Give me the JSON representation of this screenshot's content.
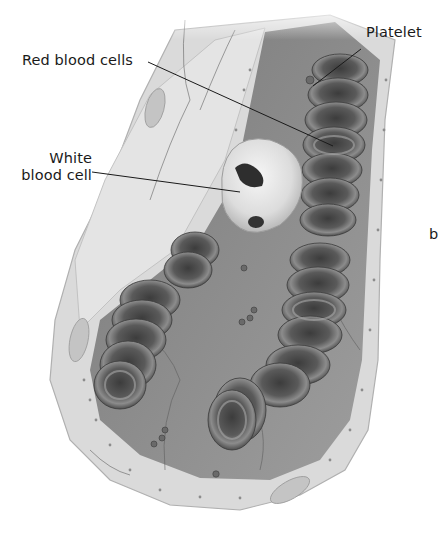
{
  "diagram": {
    "labels": [
      {
        "id": "red-blood-cells",
        "text": "Red blood cells",
        "x": 22,
        "y": 52,
        "target": [
          333,
          146
        ]
      },
      {
        "id": "white-blood-cell",
        "line1": "White",
        "line2": "blood cell",
        "x": 8,
        "y": 150,
        "target": [
          240,
          192
        ]
      },
      {
        "id": "platelet",
        "text": "Platelet",
        "x": 366,
        "y": 24,
        "target": [
          313,
          86
        ]
      },
      {
        "id": "clipped-label",
        "text": "b",
        "x": 429,
        "y": 226
      }
    ],
    "colors": {
      "vessel_wall": "#d9d9d9",
      "vessel_wall_edge": "#b5b5b5",
      "lumen": "#8a8a8a",
      "rbc_dark": "#4a4a4a",
      "rbc_mid": "#6e6e6e",
      "rbc_rim": "#9a9a9a",
      "wbc": "#e6e6e6",
      "leader_line": "#1a1a1a",
      "text": "#1a1a1a"
    }
  }
}
